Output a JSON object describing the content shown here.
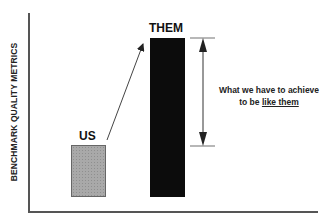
{
  "diagram": {
    "y_axis_label": "BENCHMARK QUALITY METRICS",
    "bars": [
      {
        "label": "US",
        "fill": "#a9a9a9",
        "relative_height": 52
      },
      {
        "label": "THEM",
        "fill": "#0c0c0c",
        "relative_height": 159
      }
    ],
    "gap_annotation": {
      "line1": "What we have to achieve",
      "line2_prefix": "to be ",
      "line2_underlined": "like them"
    },
    "arrow": "US → THEM",
    "colors": {
      "axis": "#555555",
      "text": "#222222"
    }
  }
}
